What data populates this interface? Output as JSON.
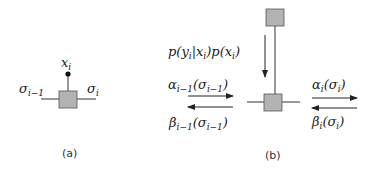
{
  "panel_a": {
    "caption": "(a)",
    "observation_label": "x",
    "observation_sub": "i",
    "left_label": "σ",
    "left_sub": "i−1",
    "right_label": "σ",
    "right_sub": "i"
  },
  "panel_b": {
    "caption": "(b)",
    "likelihood": {
      "p1": "p(y",
      "s1": "i",
      "p2": "|x",
      "s2": "i",
      "p3": ")p(x",
      "s3": "i",
      "p4": ")"
    },
    "alpha_prev": {
      "a": "α",
      "s1": "i−1",
      "b": "(σ",
      "s2": "i−1",
      "c": ")"
    },
    "beta_prev": {
      "a": "β",
      "s1": "i−1",
      "b": "(σ",
      "s2": "i−1",
      "c": ")"
    },
    "alpha_cur": {
      "a": "α",
      "s1": "i",
      "b": "(σ",
      "s2": "i",
      "c": ")"
    },
    "beta_cur": {
      "a": "β",
      "s1": "i",
      "b": "(σ",
      "s2": "i",
      "c": ")"
    }
  },
  "colors": {
    "factor_fill": "#b3b3b3",
    "stroke": "#333333"
  }
}
